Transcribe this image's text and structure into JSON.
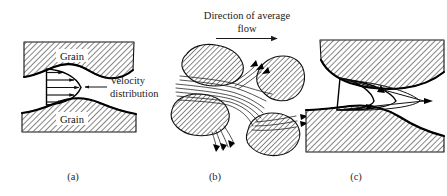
{
  "figure": {
    "title_text": "Direction of average",
    "title_text_line2": "flow",
    "annotation_velocity_line1": "Velocity",
    "annotation_velocity_line2": "distribution",
    "grain_label_upper": "Grain",
    "grain_label_lower": "Grain",
    "panel_labels": {
      "a": "(a)",
      "b": "(b)",
      "c": "(c)"
    },
    "colors": {
      "ink": "#111111",
      "hatch": "#2b2b2b",
      "background": "#ffffff",
      "outline_heavy": "#000000"
    },
    "icons": {
      "flow_direction_arrow": "arrow-right-icon",
      "leader_arrow": "arrow-left-icon"
    },
    "panels": [
      {
        "id": "a",
        "label": "(a)",
        "description": "Velocity distribution between two grains",
        "velocity_arrow_count": 5
      },
      {
        "id": "b",
        "label": "(b)",
        "description": "Tortuous flow paths through grain cluster",
        "grain_count": 4
      },
      {
        "id": "c",
        "label": "(c)",
        "description": "Nested velocity profiles in a pore throat",
        "profile_count": 3
      }
    ]
  }
}
